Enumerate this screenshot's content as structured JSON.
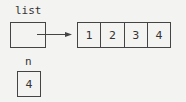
{
  "diagram": {
    "list_label": "list",
    "n_label": "n",
    "n_value": "4",
    "array_values": [
      "1",
      "2",
      "3",
      "4"
    ],
    "colors": {
      "stroke": "#444444",
      "text": "#333333",
      "background": "#f3f3f1"
    }
  }
}
